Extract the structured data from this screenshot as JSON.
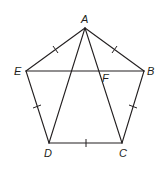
{
  "figure": {
    "type": "geometry",
    "stroke_color": "#231f20",
    "vertices": {
      "A": {
        "label": "A",
        "x": 85,
        "y": 28
      },
      "B": {
        "label": "B",
        "x": 144,
        "y": 71
      },
      "C": {
        "label": "C",
        "x": 122,
        "y": 143
      },
      "D": {
        "label": "D",
        "x": 49,
        "y": 143
      },
      "E": {
        "label": "E",
        "x": 26,
        "y": 71
      },
      "F": {
        "label": "F",
        "x": 99,
        "y": 71
      }
    },
    "sides": [
      "AB",
      "BC",
      "CD",
      "DE",
      "EA"
    ],
    "diagonals": [
      "AD",
      "AC",
      "EB"
    ],
    "congruent_tick_marks": [
      "AB",
      "BC",
      "CD",
      "DE",
      "EA"
    ]
  }
}
